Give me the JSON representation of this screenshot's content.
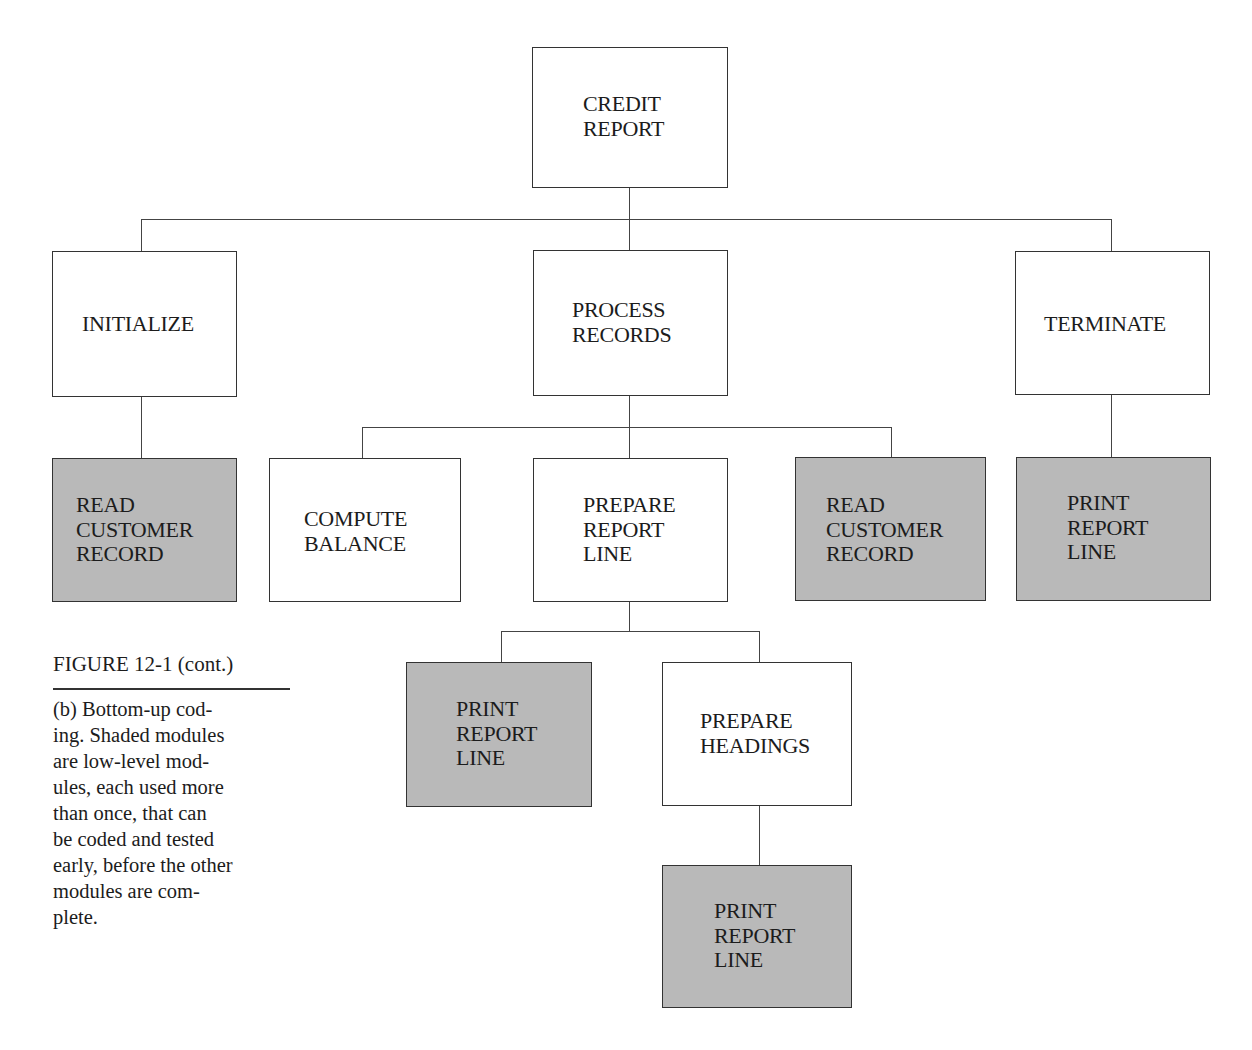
{
  "diagram": {
    "colors": {
      "shaded_fill": "#b9b9b9",
      "plain_fill": "#ffffff",
      "border": "#333333"
    },
    "nodes": {
      "credit_report": {
        "lines": [
          "CREDIT",
          "REPORT"
        ],
        "shaded": false
      },
      "initialize": {
        "lines": [
          "INITIALIZE"
        ],
        "shaded": false
      },
      "process_records": {
        "lines": [
          "PROCESS",
          "RECORDS"
        ],
        "shaded": false
      },
      "terminate": {
        "lines": [
          "TERMINATE"
        ],
        "shaded": false
      },
      "read_customer_1": {
        "lines": [
          "READ",
          "CUSTOMER",
          "RECORD"
        ],
        "shaded": true
      },
      "compute_balance": {
        "lines": [
          "COMPUTE",
          "BALANCE"
        ],
        "shaded": false
      },
      "prepare_report_line": {
        "lines": [
          "PREPARE",
          "REPORT",
          "LINE"
        ],
        "shaded": false
      },
      "read_customer_2": {
        "lines": [
          "READ",
          "CUSTOMER",
          "RECORD"
        ],
        "shaded": true
      },
      "print_report_line_1": {
        "lines": [
          "PRINT",
          "REPORT",
          "LINE"
        ],
        "shaded": true
      },
      "print_report_line_2": {
        "lines": [
          "PRINT",
          "REPORT",
          "LINE"
        ],
        "shaded": true
      },
      "prepare_headings": {
        "lines": [
          "PREPARE",
          "HEADINGS"
        ],
        "shaded": false
      },
      "print_report_line_3": {
        "lines": [
          "PRINT",
          "REPORT",
          "LINE"
        ],
        "shaded": true
      }
    },
    "edges": [
      [
        "credit_report",
        "initialize"
      ],
      [
        "credit_report",
        "process_records"
      ],
      [
        "credit_report",
        "terminate"
      ],
      [
        "initialize",
        "read_customer_1"
      ],
      [
        "terminate",
        "print_report_line_1"
      ],
      [
        "process_records",
        "compute_balance"
      ],
      [
        "process_records",
        "prepare_report_line"
      ],
      [
        "process_records",
        "read_customer_2"
      ],
      [
        "prepare_report_line",
        "print_report_line_2"
      ],
      [
        "prepare_report_line",
        "prepare_headings"
      ],
      [
        "prepare_headings",
        "print_report_line_3"
      ]
    ]
  },
  "caption": {
    "title": "FIGURE 12-1 (cont.)",
    "body_lines": [
      "(b) Bottom-up cod-",
      "ing. Shaded modules",
      "are low-level mod-",
      "ules, each used more",
      "than once, that can",
      "be coded and tested",
      "early, before the other",
      "modules are com-",
      "plete."
    ]
  }
}
